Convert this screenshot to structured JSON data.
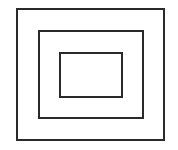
{
  "diagram": {
    "type": "nested-rectangles",
    "stroke_color": "#2a2a2a",
    "background": "#ffffff",
    "rectangles": [
      {
        "name": "outer",
        "x": 16,
        "y": 8,
        "w": 149,
        "h": 133,
        "stroke": 2
      },
      {
        "name": "middle",
        "x": 38,
        "y": 30,
        "w": 106,
        "h": 89,
        "stroke": 2
      },
      {
        "name": "inner",
        "x": 59,
        "y": 52,
        "w": 64,
        "h": 46,
        "stroke": 2
      }
    ]
  }
}
